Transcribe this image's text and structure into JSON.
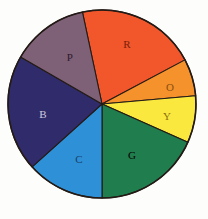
{
  "figure": {
    "title": "",
    "background_color": "#fdfdfb",
    "outline_color": "#241b16"
  },
  "chart_data": {
    "type": "pie",
    "title": "",
    "subtitle": "",
    "xlabel": "",
    "ylabel": "",
    "legend_position": "none",
    "grid": false,
    "center": {
      "x": 102,
      "y": 104
    },
    "radius": 94,
    "start_angle_deg": -12,
    "direction": "clockwise",
    "categories": [
      "R",
      "O",
      "Y",
      "G",
      "C",
      "B",
      "P"
    ],
    "values": [
      74,
      23,
      29,
      66,
      48,
      72,
      48
    ],
    "value_unit": "degrees",
    "slices": [
      {
        "label": "R",
        "name": "red",
        "start_deg": -12,
        "end_deg": 62,
        "sweep_deg": 74,
        "fill": "#F1572A",
        "label_color": "#7a1d0c",
        "label_x": 127,
        "label_y": 45
      },
      {
        "label": "O",
        "name": "orange",
        "start_deg": 62,
        "end_deg": 85,
        "sweep_deg": 23,
        "fill": "#F5922B",
        "label_color": "#8a4f10",
        "label_x": 170,
        "label_y": 88
      },
      {
        "label": "Y",
        "name": "yellow",
        "start_deg": 85,
        "end_deg": 114,
        "sweep_deg": 29,
        "fill": "#FAE83E",
        "label_color": "#8a6f12",
        "label_x": 167,
        "label_y": 117
      },
      {
        "label": "G",
        "name": "green",
        "start_deg": 114,
        "end_deg": 180,
        "sweep_deg": 66,
        "fill": "#207D4D",
        "label_color": "#10插3a",
        "label_x": 132,
        "label_y": 156
      },
      {
        "label": "C",
        "name": "cyan",
        "start_deg": 180,
        "end_deg": 228,
        "sweep_deg": 48,
        "fill": "#2E90D6",
        "label_color": "#16406d",
        "label_x": 79,
        "label_y": 160
      },
      {
        "label": "B",
        "name": "blue",
        "start_deg": 228,
        "end_deg": 300,
        "sweep_deg": 72,
        "fill": "#302C6C",
        "label_color": "#cfcadf",
        "label_x": 43,
        "label_y": 115
      },
      {
        "label": "P",
        "name": "purple",
        "start_deg": 300,
        "end_deg": 348,
        "sweep_deg": 48,
        "fill": "#7E6077",
        "label_color": "#2d1b2c",
        "label_x": 70,
        "label_y": 58
      }
    ]
  }
}
